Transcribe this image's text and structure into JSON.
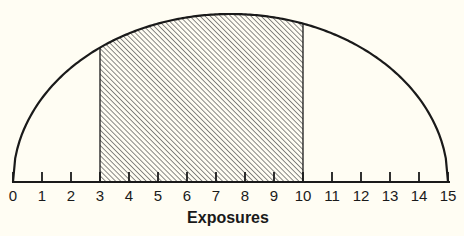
{
  "chart_data": {
    "type": "area",
    "title": "",
    "xlabel": "Exposures",
    "ylabel": "",
    "xlim": [
      0,
      15
    ],
    "x_ticks": [
      0,
      1,
      2,
      3,
      4,
      5,
      6,
      7,
      8,
      9,
      10,
      11,
      12,
      13,
      14,
      15
    ],
    "x_tick_labels": [
      "0",
      "1",
      "2",
      "3",
      "4",
      "5",
      "6",
      "7",
      "8",
      "9",
      "10",
      "11",
      "12",
      "13",
      "14",
      "15"
    ],
    "grid": false,
    "legend": null,
    "curve": {
      "shape": "semi-ellipse (distribution curve)",
      "x_start": 0,
      "x_end": 15,
      "peak_x": 7.5,
      "relative_heights": {
        "0": 0.0,
        "3": 0.81,
        "7.5": 1.0,
        "10": 0.94,
        "15": 0.0
      }
    },
    "shaded_region": {
      "x_start": 3,
      "x_end": 10,
      "fill": "diagonal-hatch"
    }
  },
  "colors": {
    "background": "#fffdf3",
    "line": "#1a1a1a",
    "hatch": "#555555"
  }
}
